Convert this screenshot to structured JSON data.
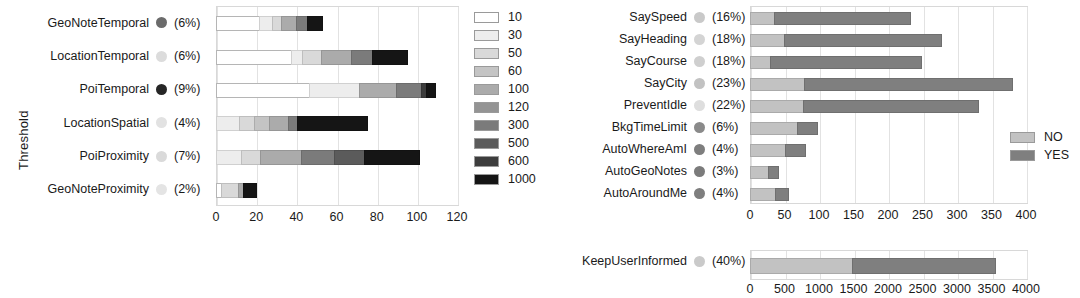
{
  "chart_data": [
    {
      "type": "bar",
      "id": "threshold-chart",
      "orientation": "horizontal",
      "stacked": true,
      "title": "",
      "xlabel": "",
      "ylabel": "Threshold",
      "xlim": [
        0,
        120
      ],
      "xticks": [
        "0",
        "20",
        "40",
        "60",
        "80",
        "100",
        "120"
      ],
      "xtick_values": [
        0,
        20,
        40,
        60,
        80,
        100,
        120
      ],
      "grid": true,
      "legend_position": "right",
      "legend_title": "",
      "categories": [
        "GeoNoteTemporal",
        "LocationTemporal",
        "PoiTemporal",
        "LocationSpatial",
        "PoiProximity",
        "GeoNoteProximity"
      ],
      "category_percents": [
        "(6%)",
        "(6%)",
        "(9%)",
        "(4%)",
        "(7%)",
        "(2%)"
      ],
      "category_dot_colors": [
        "#6b6b6b",
        "#dcdcdc",
        "#262626",
        "#e2e2e2",
        "#dadada",
        "#e4e4e4"
      ],
      "legend_entries": [
        "10",
        "30",
        "50",
        "60",
        "100",
        "120",
        "300",
        "500",
        "600",
        "1000"
      ],
      "series_colors": [
        "#ffffff",
        "#ededed",
        "#d9d9d9",
        "#c4c4c4",
        "#ababab",
        "#949494",
        "#7b7b7b",
        "#5b5b5b",
        "#3d3d3d",
        "#151515"
      ],
      "series": [
        {
          "name": "10",
          "values": [
            22,
            38,
            47,
            0,
            0,
            3
          ]
        },
        {
          "name": "30",
          "values": [
            7,
            6,
            25,
            12,
            13,
            0
          ]
        },
        {
          "name": "50",
          "values": [
            5,
            10,
            0,
            8,
            10,
            9
          ]
        },
        {
          "name": "60",
          "values": [
            0,
            0,
            0,
            8,
            0,
            0
          ]
        },
        {
          "name": "100",
          "values": [
            8,
            15,
            19,
            10,
            21,
            3
          ]
        },
        {
          "name": "120",
          "values": [
            0,
            0,
            0,
            0,
            0,
            0
          ]
        },
        {
          "name": "300",
          "values": [
            6,
            11,
            13,
            5,
            17,
            0
          ]
        },
        {
          "name": "500",
          "values": [
            0,
            0,
            0,
            0,
            15,
            0
          ]
        },
        {
          "name": "600",
          "values": [
            0,
            0,
            3,
            0,
            0,
            0
          ]
        },
        {
          "name": "1000",
          "values": [
            8,
            18,
            5,
            35,
            28,
            7
          ]
        }
      ],
      "totals": [
        56,
        98,
        112,
        78,
        104,
        22
      ]
    },
    {
      "type": "bar",
      "id": "settings-chart-upper",
      "orientation": "horizontal",
      "stacked": true,
      "title": "",
      "xlabel": "",
      "ylabel": "",
      "xlim": [
        0,
        400
      ],
      "xticks": [
        "0",
        "50",
        "100",
        "150",
        "200",
        "250",
        "300",
        "350",
        "400"
      ],
      "xtick_values": [
        0,
        50,
        100,
        150,
        200,
        250,
        300,
        350,
        400
      ],
      "grid": true,
      "legend_position": "right",
      "categories": [
        "SaySpeed",
        "SayHeading",
        "SayCourse",
        "SayCity",
        "PreventIdle",
        "BkgTimeLimit",
        "AutoWhereAmI",
        "AutoGeoNotes",
        "AutoAroundMe"
      ],
      "category_percents": [
        "(16%)",
        "(18%)",
        "(18%)",
        "(23%)",
        "(22%)",
        "(6%)",
        "(4%)",
        "(3%)",
        "(4%)"
      ],
      "category_dot_colors": [
        "#c9c9c9",
        "#d4d4d4",
        "#cfcfcf",
        "#c2c2c2",
        "#dedede",
        "#8a8a8a",
        "#7e7e7e",
        "#7b7b7b",
        "#7e7e7e"
      ],
      "legend_entries": [
        "NO",
        "YES"
      ],
      "series_colors": [
        "#c2c2c2",
        "#7f7f7f"
      ],
      "series": [
        {
          "name": "NO",
          "values": [
            36,
            50,
            30,
            80,
            78,
            70,
            52,
            28,
            38
          ]
        },
        {
          "name": "YES",
          "values": [
            199,
            230,
            221,
            303,
            256,
            30,
            30,
            16,
            20
          ]
        }
      ],
      "totals": [
        235,
        280,
        251,
        383,
        334,
        100,
        82,
        44,
        58
      ]
    },
    {
      "type": "bar",
      "id": "settings-chart-lower",
      "orientation": "horizontal",
      "stacked": true,
      "title": "",
      "xlabel": "",
      "ylabel": "",
      "xlim": [
        0,
        4000
      ],
      "xticks": [
        "0",
        "500",
        "1000",
        "1500",
        "2000",
        "2500",
        "3000",
        "3500",
        "4000"
      ],
      "xtick_values": [
        0,
        500,
        1000,
        1500,
        2000,
        2500,
        3000,
        3500,
        4000
      ],
      "grid": true,
      "categories": [
        "KeepUserInformed"
      ],
      "category_percents": [
        "(40%)"
      ],
      "category_dot_colors": [
        "#cacaca"
      ],
      "legend_entries": [
        "NO",
        "YES"
      ],
      "series_colors": [
        "#c2c2c2",
        "#7f7f7f"
      ],
      "series": [
        {
          "name": "NO",
          "values": [
            1490
          ]
        },
        {
          "name": "YES",
          "values": [
            2090
          ]
        }
      ],
      "totals": [
        3580
      ]
    }
  ]
}
